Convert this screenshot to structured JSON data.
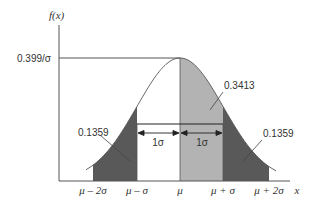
{
  "diagram": {
    "y_axis_label": "f(x)",
    "x_axis_label": "x",
    "peak_label": "0.399/σ",
    "x_ticks": [
      "μ – 2σ",
      "μ – σ",
      "μ",
      "μ + σ",
      "μ + 2σ"
    ],
    "areas": {
      "center_right": "0.3413",
      "left_tail": "0.1359",
      "right_tail": "0.1359"
    },
    "interval_labels": [
      "1σ",
      "1σ"
    ],
    "colors": {
      "center_fill": "#b3b3b3",
      "tail_fill": "#595959",
      "line": "#444444",
      "background": "#ffffff"
    }
  }
}
